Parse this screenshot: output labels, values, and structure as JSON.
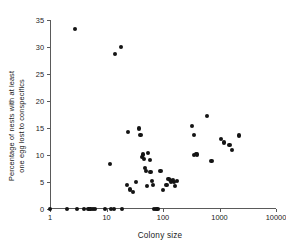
{
  "figure": {
    "background": "#ffffff",
    "marker_color": "#141414",
    "axis_color": "#5a5a5a"
  },
  "chart_data": {
    "type": "scatter",
    "title": "",
    "xlabel": "Colony size",
    "ylabel": "Percentage of nests with at least\none egg lost to conspecifics",
    "xscale": "log",
    "yscale": "linear",
    "xlim": [
      1,
      10000
    ],
    "ylim": [
      0,
      35
    ],
    "xticks": [
      1,
      10,
      100,
      1000,
      10000
    ],
    "xtick_labels": [
      "1",
      "10",
      "100",
      "1000",
      "10000"
    ],
    "yticks": [
      0,
      5,
      10,
      15,
      20,
      25,
      30,
      35
    ],
    "ytick_labels": [
      "0",
      "5",
      "10",
      "15",
      "20",
      "25",
      "30",
      "35"
    ],
    "grid": false,
    "legend": null,
    "points": [
      [
        1.0,
        0.0
      ],
      [
        2.0,
        0.0
      ],
      [
        2.8,
        33.3
      ],
      [
        3.0,
        0.0
      ],
      [
        4.0,
        0.0
      ],
      [
        4.8,
        0.0
      ],
      [
        5.2,
        0.0
      ],
      [
        5.8,
        0.0
      ],
      [
        6.2,
        0.0
      ],
      [
        9.5,
        0.0
      ],
      [
        11.5,
        8.3
      ],
      [
        12.0,
        0.0
      ],
      [
        13.5,
        0.0
      ],
      [
        14.0,
        28.7
      ],
      [
        18.0,
        30.0
      ],
      [
        19.0,
        0.0
      ],
      [
        23.0,
        4.4
      ],
      [
        24.0,
        14.2
      ],
      [
        26.0,
        3.6
      ],
      [
        29.0,
        3.1
      ],
      [
        33.0,
        5.0
      ],
      [
        38.0,
        14.9
      ],
      [
        40.0,
        13.7
      ],
      [
        42.0,
        9.7
      ],
      [
        44.0,
        10.1
      ],
      [
        46.0,
        9.3
      ],
      [
        48.0,
        7.6
      ],
      [
        50.0,
        7.1
      ],
      [
        52.0,
        4.3
      ],
      [
        55.0,
        10.4
      ],
      [
        58.0,
        9.0
      ],
      [
        60.0,
        6.8
      ],
      [
        63.0,
        5.2
      ],
      [
        66.0,
        4.4
      ],
      [
        70.0,
        0.0
      ],
      [
        75.0,
        0.0
      ],
      [
        80.0,
        0.0
      ],
      [
        90.0,
        7.0
      ],
      [
        100.0,
        3.5
      ],
      [
        115.0,
        4.4
      ],
      [
        125.0,
        5.6
      ],
      [
        135.0,
        5.3
      ],
      [
        140.0,
        5.1
      ],
      [
        150.0,
        5.4
      ],
      [
        155.0,
        5.0
      ],
      [
        165.0,
        4.2
      ],
      [
        175.0,
        5.2
      ],
      [
        330.0,
        15.4
      ],
      [
        350.0,
        13.7
      ],
      [
        350.0,
        10.0
      ],
      [
        380.0,
        10.2
      ],
      [
        400.0,
        10.1
      ],
      [
        600.0,
        17.2
      ],
      [
        720.0,
        8.9
      ],
      [
        1050.0,
        12.9
      ],
      [
        1200.0,
        12.3
      ],
      [
        1500.0,
        11.8
      ],
      [
        1650.0,
        11.0
      ],
      [
        2200.0,
        13.6
      ]
    ]
  }
}
